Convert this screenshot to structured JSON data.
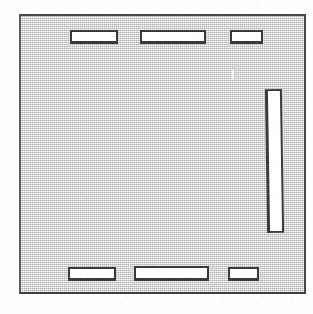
{
  "figure": {
    "type": "line-drawing",
    "canvas": {
      "width": 313,
      "height": 314
    },
    "colors": {
      "page_background": "#fefefe",
      "panel_fill": "#d2d2d2",
      "outline": "#3a3a3a",
      "frame_outline": "#4a4a4a",
      "slot_fill": "#ffffff"
    },
    "panel": {
      "label": "panel-body",
      "x": 19,
      "y": 14,
      "width": 287,
      "height": 280,
      "border_width": 2
    },
    "slots": [
      {
        "name": "slot-top-left",
        "x": 70,
        "y": 30,
        "width": 48,
        "height": 14,
        "orientation": "horizontal"
      },
      {
        "name": "slot-top-center",
        "x": 140,
        "y": 30,
        "width": 66,
        "height": 14,
        "orientation": "horizontal"
      },
      {
        "name": "slot-top-right",
        "x": 230,
        "y": 30,
        "width": 33,
        "height": 14,
        "orientation": "horizontal"
      },
      {
        "name": "slot-right-tall",
        "x": 266,
        "y": 89,
        "width": 17,
        "height": 144,
        "orientation": "vertical"
      },
      {
        "name": "slot-bottom-left",
        "x": 68,
        "y": 267,
        "width": 48,
        "height": 14,
        "orientation": "horizontal"
      },
      {
        "name": "slot-bottom-center",
        "x": 134,
        "y": 266,
        "width": 75,
        "height": 15,
        "orientation": "horizontal"
      },
      {
        "name": "slot-bottom-right",
        "x": 228,
        "y": 267,
        "width": 31,
        "height": 14,
        "orientation": "horizontal"
      }
    ],
    "artifacts": [
      {
        "name": "scan-mark",
        "x": 232,
        "y": 70,
        "width": 2,
        "height": 9
      }
    ]
  }
}
